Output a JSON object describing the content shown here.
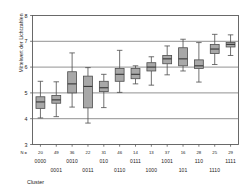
{
  "chart_data": {
    "type": "boxplot",
    "title": "",
    "xlabel": "Cluster",
    "ylabel": "Mittelwert der Lichtzahlen",
    "ylim": [
      3,
      8
    ],
    "yticks": [
      3,
      4,
      5,
      6,
      7,
      8
    ],
    "grid": true,
    "legend": null,
    "n_prefix": "N =",
    "categories": [
      "0000",
      "0001",
      "0010",
      "0011",
      "010",
      "0110",
      "0111",
      "1000",
      "1001",
      "101",
      "110",
      "1110",
      "1111"
    ],
    "counts": [
      20,
      49,
      36,
      22,
      31,
      46,
      14,
      13,
      37,
      16,
      28,
      25,
      29
    ],
    "boxes": [
      {
        "cluster": "0000",
        "n": 20,
        "min": 4.03,
        "q1": 4.4,
        "median": 4.65,
        "q3": 4.85,
        "max": 5.45
      },
      {
        "cluster": "0001",
        "n": 49,
        "min": 4.08,
        "q1": 4.6,
        "median": 4.73,
        "q3": 4.9,
        "max": 5.43
      },
      {
        "cluster": "0010",
        "n": 36,
        "min": 4.45,
        "q1": 5.0,
        "median": 5.35,
        "q3": 5.82,
        "max": 6.55
      },
      {
        "cluster": "0011",
        "n": 22,
        "min": 3.83,
        "q1": 4.42,
        "median": 5.25,
        "q3": 5.65,
        "max": 5.98
      },
      {
        "cluster": "010",
        "n": 31,
        "min": 4.43,
        "q1": 5.05,
        "median": 5.2,
        "q3": 5.45,
        "max": 5.72
      },
      {
        "cluster": "0110",
        "n": 46,
        "min": 5.02,
        "q1": 5.45,
        "median": 5.72,
        "q3": 5.95,
        "max": 6.65
      },
      {
        "cluster": "0111",
        "n": 14,
        "min": 5.35,
        "q1": 5.55,
        "median": 5.72,
        "q3": 5.95,
        "max": 6.05
      },
      {
        "cluster": "1000",
        "n": 13,
        "min": 5.3,
        "q1": 5.85,
        "median": 6.0,
        "q3": 6.17,
        "max": 6.4
      },
      {
        "cluster": "1001",
        "n": 37,
        "min": 5.7,
        "q1": 6.13,
        "median": 6.32,
        "q3": 6.45,
        "max": 6.82
      },
      {
        "cluster": "101",
        "n": 16,
        "min": 5.85,
        "q1": 6.05,
        "median": 6.32,
        "q3": 6.75,
        "max": 7.08
      },
      {
        "cluster": "110",
        "n": 28,
        "min": 5.42,
        "q1": 5.95,
        "median": 6.05,
        "q3": 6.28,
        "max": 6.95
      },
      {
        "cluster": "1110",
        "n": 25,
        "min": 6.1,
        "q1": 6.53,
        "median": 6.7,
        "q3": 6.88,
        "max": 7.27
      },
      {
        "cluster": "1111",
        "n": 29,
        "min": 6.45,
        "q1": 6.78,
        "median": 6.88,
        "q3": 6.95,
        "max": 7.25
      }
    ],
    "colors": {
      "box_fill": "#a8a8a8",
      "box_edge": "#4d4d4d",
      "median": "#3a3a3a",
      "whisker": "#4d4d4d",
      "grid": "#6e6e6e",
      "axis": "#5a5a5a",
      "text": "#1a1a1a",
      "background": "#ffffff"
    },
    "label_rows": [
      {
        "row": 0,
        "clusters": [
          "0000",
          "0010",
          "010",
          "0111",
          "1001",
          "110",
          "1111"
        ]
      },
      {
        "row": 1,
        "clusters": [
          "0001",
          "0011",
          "0110",
          "1000",
          "101",
          "1110"
        ]
      }
    ]
  }
}
